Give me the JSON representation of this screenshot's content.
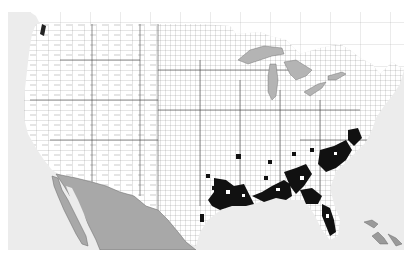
{
  "map": {
    "type": "choropleth-county-map",
    "region": "Contiguous United States with southern Canada and northern Mexico",
    "colors": {
      "ocean": "#ececec",
      "us_land": "#ffffff",
      "county_borders": "#555555",
      "canada_land": "#ffffff",
      "mexico_land": "#a8a8a8",
      "great_lakes": "#b4b4b4",
      "highlighted_counties": "#111111",
      "caribbean_islands": "#9a9a9a"
    },
    "highlighted_region": "Southeastern US coastal plain: east Texas, Louisiana, Mississippi, Alabama, Georgia, Florida, South Carolina, North Carolina"
  }
}
